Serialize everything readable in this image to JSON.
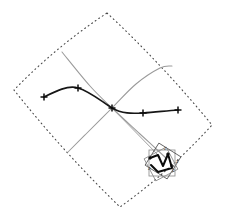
{
  "figure": {
    "background_color": "#ffffff",
    "width": 226,
    "height": 221
  },
  "chart_data": {
    "type": "line",
    "title": "",
    "xlabel": "",
    "ylabel": "",
    "xlim": [
      0,
      226
    ],
    "ylim": [
      221,
      0
    ],
    "grid": false,
    "legend": null,
    "annotations": [],
    "series": [
      {
        "name": "domain-boundary",
        "style": "dotted",
        "color": "#4a4a4a",
        "closed": true,
        "description": "Dotted curved quadrilateral (rotated square with bowed sides)",
        "corners": [
          {
            "x": 107,
            "y": 13
          },
          {
            "x": 212,
            "y": 125
          },
          {
            "x": 120,
            "y": 207
          },
          {
            "x": 14,
            "y": 90
          }
        ]
      },
      {
        "name": "gray-curve-descending",
        "style": "solid",
        "color": "#9a9a9a",
        "description": "Gray curve from upper-left falling through the center crossing to lower-right cluster",
        "points": [
          {
            "x": 62,
            "y": 52
          },
          {
            "x": 90,
            "y": 86
          },
          {
            "x": 112,
            "y": 108
          },
          {
            "x": 140,
            "y": 134
          },
          {
            "x": 166,
            "y": 158
          }
        ]
      },
      {
        "name": "gray-curve-ascending",
        "style": "solid",
        "color": "#9a9a9a",
        "description": "Gray curve rising from lower-left through the center crossing up to the right peak",
        "points": [
          {
            "x": 68,
            "y": 152
          },
          {
            "x": 86,
            "y": 134
          },
          {
            "x": 112,
            "y": 108
          },
          {
            "x": 136,
            "y": 84
          },
          {
            "x": 160,
            "y": 68
          },
          {
            "x": 172,
            "y": 66
          }
        ]
      },
      {
        "name": "dark-spline",
        "style": "solid",
        "color": "#161616",
        "description": "Heavy dark interpolating spline through five cross markers",
        "points": [
          {
            "x": 44,
            "y": 97
          },
          {
            "x": 78,
            "y": 88
          },
          {
            "x": 112,
            "y": 108
          },
          {
            "x": 143,
            "y": 113
          },
          {
            "x": 178,
            "y": 110
          }
        ]
      }
    ],
    "markers": {
      "name": "control-points",
      "shape": "plus-cross",
      "color": "#0d0d0d",
      "size": 7,
      "points": [
        {
          "x": 44,
          "y": 97
        },
        {
          "x": 78,
          "y": 88
        },
        {
          "x": 112,
          "y": 108
        },
        {
          "x": 143,
          "y": 113
        },
        {
          "x": 178,
          "y": 110
        }
      ]
    },
    "inset": {
      "name": "detail-cluster",
      "description": "Cluster of overlapping rotated squares with a dark zigzag spline and small labels",
      "center": {
        "x": 162,
        "y": 162
      },
      "squares": [
        {
          "cx": 162,
          "cy": 163,
          "size": 26,
          "rotation": 0
        },
        {
          "cx": 163,
          "cy": 161,
          "size": 26,
          "rotation": 32
        },
        {
          "cx": 161,
          "cy": 164,
          "size": 25,
          "rotation": 62
        }
      ],
      "spline_points": [
        {
          "x": 150,
          "y": 158
        },
        {
          "x": 158,
          "y": 155
        },
        {
          "x": 163,
          "y": 166
        },
        {
          "x": 168,
          "y": 154
        },
        {
          "x": 172,
          "y": 168
        },
        {
          "x": 158,
          "y": 172
        },
        {
          "x": 151,
          "y": 165
        }
      ],
      "labels": [
        {
          "text": "Z",
          "x": 164,
          "y": 150
        },
        {
          "text": "Z",
          "x": 176,
          "y": 163
        },
        {
          "text": "Z",
          "x": 172,
          "y": 172
        },
        {
          "text": "Z",
          "x": 148,
          "y": 170
        }
      ]
    }
  }
}
